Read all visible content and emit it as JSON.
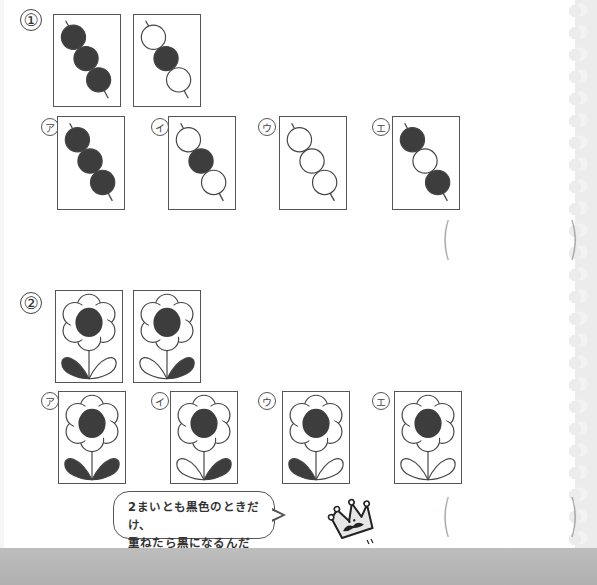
{
  "questions": [
    {
      "number": "①",
      "type": "dango",
      "given": [
        {
          "balls": [
            "black",
            "black",
            "black"
          ]
        },
        {
          "balls": [
            "white",
            "black",
            "white"
          ]
        }
      ],
      "options": [
        {
          "label": "ア",
          "balls": [
            "black",
            "black",
            "black"
          ]
        },
        {
          "label": "イ",
          "balls": [
            "white",
            "black",
            "white"
          ]
        },
        {
          "label": "ウ",
          "balls": [
            "white",
            "white",
            "white"
          ]
        },
        {
          "label": "エ",
          "balls": [
            "black",
            "white",
            "black"
          ]
        }
      ],
      "answer_open": "(",
      "answer_close": ")"
    },
    {
      "number": "②",
      "type": "flower",
      "given": [
        {
          "center": "black",
          "left_leaf": "black",
          "right_leaf": "white"
        },
        {
          "center": "black",
          "left_leaf": "white",
          "right_leaf": "black"
        }
      ],
      "options": [
        {
          "label": "ア",
          "center": "black",
          "left_leaf": "black",
          "right_leaf": "black"
        },
        {
          "label": "イ",
          "center": "black",
          "left_leaf": "white",
          "right_leaf": "black"
        },
        {
          "label": "ウ",
          "center": "black",
          "left_leaf": "black",
          "right_leaf": "white"
        },
        {
          "label": "エ",
          "center": "black",
          "left_leaf": "white",
          "right_leaf": "white"
        }
      ],
      "answer_open": "(",
      "answer_close": ")"
    }
  ],
  "hint": {
    "line1": "2まいとも黒色のときだけ、",
    "line2": "重ねたら黒になるんだね。"
  },
  "mascot": {
    "icon": "crown-mustache-icon"
  },
  "colors": {
    "black_fill": "#3d3d3d",
    "stroke": "#444444",
    "paren": "#999999"
  }
}
